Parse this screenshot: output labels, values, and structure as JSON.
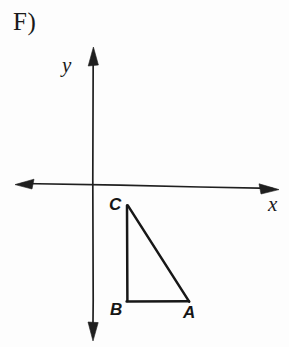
{
  "figure": {
    "problem_label": "F)",
    "background_color": "#fdfdfd",
    "ink_color": "#1a1a1a"
  },
  "axes": {
    "x_axis": {
      "label": "x",
      "name": "x-axis",
      "start": [
        16,
        183
      ],
      "end": [
        278,
        189
      ],
      "arrow_both_ends": true
    },
    "y_axis": {
      "label": "y",
      "name": "y-axis",
      "start": [
        93,
        48
      ],
      "end": [
        93,
        340
      ],
      "arrow_both_ends": true
    },
    "origin": [
      93,
      186
    ]
  },
  "shape": {
    "name": "triangle ABC",
    "type": "right triangle",
    "vertices": [
      {
        "label": "C",
        "x": 127,
        "y": 205
      },
      {
        "label": "B",
        "x": 127,
        "y": 301
      },
      {
        "label": "A",
        "x": 188,
        "y": 301
      }
    ],
    "right_angle_at": "B",
    "quadrant": "IV",
    "stroke_width": 2.4
  },
  "labels": {
    "C": "C",
    "B": "B",
    "A": "A"
  }
}
